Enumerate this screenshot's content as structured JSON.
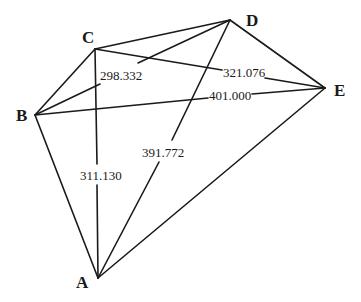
{
  "diagram": {
    "type": "network-graph",
    "vertices": [
      {
        "id": "A",
        "label": "A",
        "x": 98,
        "y": 278,
        "label_x": 76,
        "label_y": 287
      },
      {
        "id": "B",
        "label": "B",
        "x": 35,
        "y": 115,
        "label_x": 15,
        "label_y": 121
      },
      {
        "id": "C",
        "label": "C",
        "x": 95,
        "y": 49,
        "label_x": 82,
        "label_y": 43
      },
      {
        "id": "D",
        "label": "D",
        "x": 230,
        "y": 20,
        "label_x": 245,
        "label_y": 25
      },
      {
        "id": "E",
        "label": "E",
        "x": 325,
        "y": 88,
        "label_x": 334,
        "label_y": 95
      }
    ],
    "edges": [
      {
        "from": "C",
        "to": "D"
      },
      {
        "from": "D",
        "to": "E"
      },
      {
        "from": "E",
        "to": "A"
      },
      {
        "from": "B",
        "to": "C"
      },
      {
        "from": "B",
        "to": "A"
      },
      {
        "from": "B",
        "to": "D",
        "label": "298.332"
      },
      {
        "from": "C",
        "to": "E",
        "label": "321.076"
      },
      {
        "from": "B",
        "to": "E",
        "label": "401.000"
      },
      {
        "from": "C",
        "to": "A",
        "label": "311.130"
      },
      {
        "from": "A",
        "to": "D",
        "label": "391.772"
      }
    ],
    "edge_labels": {
      "BD": "298.332",
      "CE": "321.076",
      "BE": "401.000",
      "CA": "311.130",
      "AD": "391.772"
    },
    "vertex_labels": {
      "A": "A",
      "B": "B",
      "C": "C",
      "D": "D",
      "E": "E"
    }
  }
}
